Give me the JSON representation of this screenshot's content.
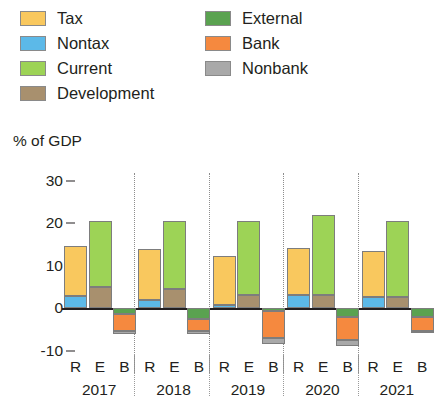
{
  "axis_title": "% of GDP",
  "legend": {
    "left_column": [
      {
        "label": "Tax",
        "color": "#F9C85E",
        "icon": "legend-swatch-icon"
      },
      {
        "label": "Nontax",
        "color": "#5CB9E8",
        "icon": "legend-swatch-icon"
      },
      {
        "label": "Current",
        "color": "#9DD356",
        "icon": "legend-swatch-icon"
      },
      {
        "label": "Development",
        "color": "#A8906E",
        "icon": "legend-swatch-icon"
      }
    ],
    "right_column": [
      {
        "label": "External",
        "color": "#5AA250",
        "icon": "legend-swatch-icon"
      },
      {
        "label": "Bank",
        "color": "#F5893F",
        "icon": "legend-swatch-icon"
      },
      {
        "label": "Nonbank",
        "color": "#A9A9A9",
        "icon": "legend-swatch-icon"
      }
    ]
  },
  "chart_data": {
    "type": "bar",
    "subtype": "stacked-grouped",
    "title": "",
    "xlabel": "",
    "ylabel": "% of GDP",
    "ylim": [
      -14,
      32
    ],
    "yticks": [
      30,
      20,
      10,
      0,
      -10
    ],
    "ytick_labels": [
      "30",
      "20",
      "10",
      "0",
      "-10"
    ],
    "grid": false,
    "legend_position": "top",
    "group_labels": [
      "2017",
      "2018",
      "2019",
      "2020",
      "2021"
    ],
    "bar_labels": [
      "R",
      "E",
      "B"
    ],
    "bar_label_meaning": {
      "R": "Revenue",
      "E": "Expenditure",
      "B": "Financing/Balance"
    },
    "series": [
      {
        "name": "Tax",
        "color": "#F9C85E",
        "bar": "R",
        "values": [
          11.6,
          12.0,
          11.4,
          11.1,
          11.0
        ]
      },
      {
        "name": "Nontax",
        "color": "#5CB9E8",
        "bar": "R",
        "values": [
          2.9,
          2.0,
          0.8,
          3.0,
          2.5
        ]
      },
      {
        "name": "Current",
        "color": "#9DD356",
        "bar": "E",
        "values": [
          15.5,
          16.0,
          17.5,
          19.0,
          18.0
        ]
      },
      {
        "name": "Development",
        "color": "#A8906E",
        "bar": "E",
        "values": [
          5.0,
          4.5,
          3.0,
          3.0,
          2.5
        ]
      },
      {
        "name": "External",
        "color": "#5AA250",
        "bar": "B",
        "values": [
          -1.3,
          -2.5,
          -0.7,
          -2.0,
          -2.0
        ]
      },
      {
        "name": "Bank",
        "color": "#F5893F",
        "bar": "B",
        "values": [
          -4.2,
          -3.0,
          -6.3,
          -5.5,
          -3.5
        ]
      },
      {
        "name": "Nonbank",
        "color": "#A9A9A9",
        "bar": "B",
        "values": [
          -0.5,
          -0.6,
          -1.5,
          -1.5,
          -0.4
        ]
      }
    ],
    "group_totals": {
      "R": [
        14.5,
        14.0,
        12.2,
        14.1,
        13.5
      ],
      "E": [
        20.5,
        20.5,
        20.5,
        22.0,
        20.5
      ],
      "B": [
        -6.0,
        -6.1,
        -8.5,
        -9.0,
        -5.9
      ]
    }
  },
  "xaxis": {
    "groups": [
      {
        "year": "2017",
        "letters": [
          "R",
          "E",
          "B"
        ]
      },
      {
        "year": "2018",
        "letters": [
          "R",
          "E",
          "B"
        ]
      },
      {
        "year": "2019",
        "letters": [
          "R",
          "E",
          "B"
        ]
      },
      {
        "year": "2020",
        "letters": [
          "R",
          "E",
          "B"
        ]
      },
      {
        "year": "2021",
        "letters": [
          "R",
          "E",
          "B"
        ]
      }
    ]
  }
}
